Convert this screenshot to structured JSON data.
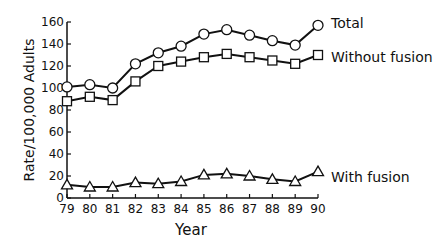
{
  "chart_data": {
    "type": "line",
    "title": "",
    "xlabel": "Year",
    "ylabel": "Rate/100,000 Adults",
    "x": [
      "79",
      "80",
      "81",
      "82",
      "83",
      "84",
      "85",
      "86",
      "87",
      "88",
      "89",
      "90"
    ],
    "ylim": [
      0,
      160
    ],
    "yticks": [
      0,
      20,
      40,
      60,
      80,
      100,
      120,
      140,
      160
    ],
    "grid": false,
    "legend_position": "inline-right",
    "series": [
      {
        "name": "Total",
        "marker": "circle",
        "values": [
          101,
          103,
          100,
          122,
          132,
          138,
          149,
          153,
          148,
          143,
          139,
          157
        ]
      },
      {
        "name": "Without fusion",
        "marker": "square",
        "values": [
          88,
          92,
          89,
          106,
          120,
          124,
          128,
          131,
          128,
          125,
          122,
          130
        ]
      },
      {
        "name": "With fusion",
        "marker": "triangle",
        "values": [
          12,
          10,
          10,
          14,
          13,
          15,
          21,
          22,
          20,
          17,
          15,
          24
        ]
      }
    ]
  },
  "labels": {
    "xlabel": "Year",
    "ylabel": "Rate/100,000 Adults",
    "series_total": "Total",
    "series_without": "Without fusion",
    "series_with": "With fusion"
  }
}
